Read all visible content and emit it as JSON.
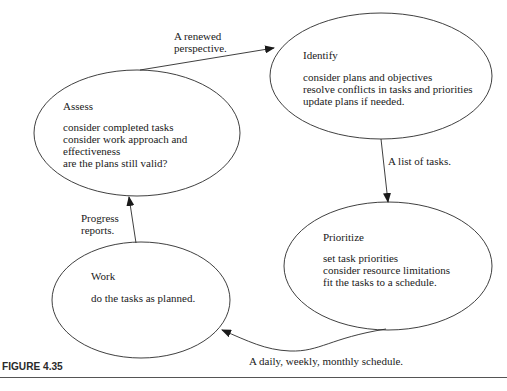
{
  "nodes": {
    "identify": {
      "title": "Identify",
      "lines": [
        "consider plans and objectives",
        "resolve conflicts in tasks and priorities",
        "update plans if needed."
      ]
    },
    "assess": {
      "title": "Assess",
      "lines": [
        "consider completed tasks",
        "consider work approach and",
        "effectiveness",
        "are the plans still valid?"
      ]
    },
    "prioritize": {
      "title": "Prioritize",
      "lines": [
        "set task priorities",
        "consider resource limitations",
        "fit the tasks to a schedule."
      ]
    },
    "work": {
      "title": "Work",
      "lines": [
        "do the tasks as planned."
      ]
    }
  },
  "edges": {
    "assess_to_identify": {
      "lines": [
        "A renewed",
        "perspective."
      ]
    },
    "identify_to_prioritize": {
      "lines": [
        "A list of tasks."
      ]
    },
    "prioritize_to_work": {
      "lines": [
        "A daily, weekly, monthly schedule."
      ]
    },
    "work_to_assess": {
      "lines": [
        "Progress",
        "reports."
      ]
    }
  },
  "caption": "FIGURE 4.35",
  "colors": {
    "stroke": "#2a2a2a",
    "text": "#1a1a1a",
    "background": "#ffffff"
  }
}
